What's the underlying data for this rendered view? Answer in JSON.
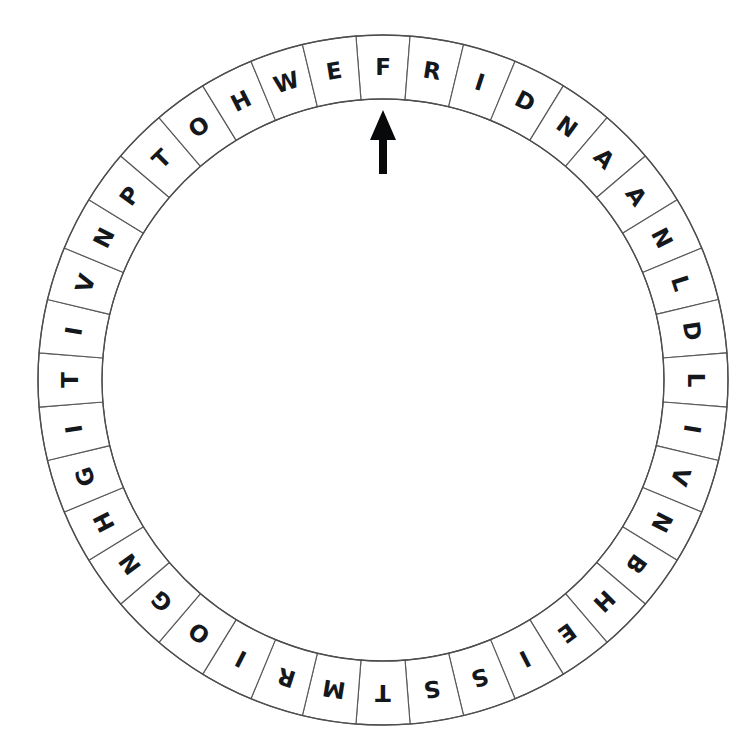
{
  "diagram": {
    "type": "circular-letter-wheel",
    "background_color": "#ffffff",
    "cell_fill": "#ffffff",
    "cell_stroke": "#5a5a5a",
    "letter_color": "#14181c",
    "arrow_color": "#08090b"
  },
  "wheel": {
    "center_x": 383,
    "center_y": 380,
    "outer_radius": 345,
    "inner_radius": 281,
    "cell_count": 40,
    "start_angle_deg": -90,
    "letters_clockwise_from_pointer": [
      "F",
      "R",
      "I",
      "D",
      "N",
      "A",
      "A",
      "N",
      "L",
      "D",
      "L",
      "I",
      "V",
      "N",
      "B",
      "H",
      "E",
      "I",
      "S",
      "S",
      "T",
      "M",
      "R",
      "I",
      "O",
      "G",
      "N",
      "H",
      "G",
      "I",
      "T",
      "I",
      "V",
      "N",
      "P",
      "T",
      "O",
      "H",
      "W",
      "E",
      "E",
      "L",
      "R",
      "O"
    ],
    "letters": [
      "F",
      "R",
      "I",
      "D",
      "N",
      "A",
      "A",
      "N",
      "L",
      "D",
      "L",
      "I",
      "V",
      "N",
      "B",
      "H",
      "E",
      "I",
      "S",
      "S",
      "T",
      "M",
      "R",
      "I",
      "O",
      "G",
      "N",
      "H",
      "G",
      "I",
      "T",
      "I",
      "V",
      "N",
      "P",
      "T",
      "O",
      "H",
      "W",
      "E",
      "E",
      "L",
      "R",
      "O"
    ],
    "letter_string": "FRIDNAANLDLIVNBHEISSTMRIOGNHGITIVNPTOHWEELRO"
  },
  "pointer": {
    "name": "arrow-pointer",
    "points_to_letter": "F",
    "points_to_index": 0,
    "direction": "up",
    "tip_x": 383,
    "tip_y": 110,
    "tail_y": 174,
    "head_width": 26,
    "head_height": 30,
    "shaft_width": 8
  }
}
